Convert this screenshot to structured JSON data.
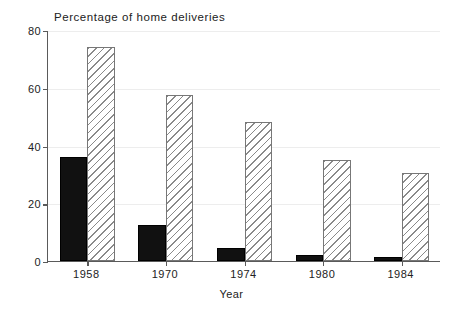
{
  "chart_data": {
    "type": "bar",
    "title": "Percentage of home deliveries",
    "xlabel": "Year",
    "ylabel": "",
    "categories": [
      "1958",
      "1970",
      "1974",
      "1980",
      "1984"
    ],
    "series": [
      {
        "name": "solid-series",
        "style": "solid-black",
        "values": [
          36,
          12.5,
          4.5,
          2,
          1.5
        ]
      },
      {
        "name": "hatched-series",
        "style": "diagonal-hatch",
        "values": [
          74,
          57.5,
          48,
          35,
          30.5
        ]
      }
    ],
    "ylim": [
      0,
      80
    ],
    "yticks": [
      0,
      20,
      40,
      60,
      80
    ],
    "ytick_labels": [
      "0",
      "20",
      "40",
      "60",
      "80"
    ],
    "grid": true,
    "legend": "none",
    "colors": {
      "solid": "#111111",
      "hatch_line": "#8a8a8a",
      "axis": "#5a5a5a",
      "grid": "#ededed"
    }
  }
}
